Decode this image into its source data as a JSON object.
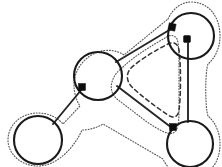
{
  "figure": {
    "title": "Graph diagram with circular vertices, connecting edges and offset boundary contour",
    "caption": "",
    "background_color": "#ffffff",
    "width": 222,
    "height": 167
  },
  "style": {
    "solid_color": "#1a1a1a",
    "edge_color": "#262626",
    "dashed_color": "#333333",
    "dotted_color": "#595959",
    "marker_color": "#0d0d0d",
    "solid_width": 2.1,
    "edge_width": 1.9,
    "dashed_width": 1.5,
    "dotted_width": 1.15,
    "dashed_pattern": "4 3.2",
    "dotted_pattern": "0.9 1.9"
  },
  "circles": [
    {
      "id": "circle-top-right",
      "label": "top-right circle",
      "cx": 191,
      "cy": 36,
      "r": 23
    },
    {
      "id": "circle-middle",
      "label": "middle circle",
      "cx": 98,
      "cy": 76,
      "r": 24
    },
    {
      "id": "circle-bottom-left",
      "label": "bottom-left circle",
      "cx": 38,
      "cy": 140,
      "r": 24
    },
    {
      "id": "circle-bottom-right",
      "label": "bottom-right circle",
      "cx": 190,
      "cy": 144,
      "r": 23
    }
  ],
  "markers": [
    {
      "id": "marker-top-left",
      "label": "marker on top-right circle left side",
      "x": 172,
      "y": 27,
      "size": 7,
      "rotation": 12
    },
    {
      "id": "marker-top-bottom",
      "label": "marker on top-right circle bottom",
      "x": 187,
      "y": 39,
      "size": 7,
      "rotation": 0
    },
    {
      "id": "marker-middle",
      "label": "marker on middle circle lower-left",
      "x": 82,
      "y": 87,
      "size": 7,
      "rotation": 0
    },
    {
      "id": "marker-bottom-right",
      "label": "marker on bottom-right circle upper-left",
      "x": 173,
      "y": 127,
      "size": 7,
      "rotation": 0
    }
  ],
  "edges": [
    {
      "id": "edge-middle-to-topright",
      "label": "edge from middle circle to top-right circle",
      "from": "circle-middle",
      "to": "circle-top-right",
      "path": "M 116 62 L 171 29"
    },
    {
      "id": "edge-middle-to-bottomright",
      "label": "edge from middle circle to bottom-right circle",
      "from": "circle-middle",
      "to": "circle-bottom-right",
      "path": "M 117 86 L 172 128"
    },
    {
      "id": "edge-topright-to-bottomright",
      "label": "vertical edge from top-right circle to bottom-right circle",
      "from": "circle-top-right",
      "to": "circle-bottom-right",
      "path": "M 188 43 L 188 122"
    },
    {
      "id": "edge-middle-to-bottomleft",
      "label": "edge from middle circle to bottom-left circle",
      "from": "circle-middle",
      "to": "circle-bottom-left",
      "path": "M 82 89 L 53 124"
    }
  ],
  "inner_curve": {
    "id": "inner-dashed-triangle",
    "label": "dashed rounded triangle inside the edge triangle",
    "path": "M 131 68 C 142 58 158 49 168 44 C 174 41 178 44 179 50 C 181 64 181 96 179 110 C 178 117 174 119 168 115 C 156 107 140 95 132 87 C 126 81 126 73 131 68 Z"
  },
  "outer_contour": {
    "id": "outer-dotted-contour",
    "label": "dotted offset boundary surrounding the whole graph",
    "description": "dotted curve following the graph at constant offset"
  }
}
